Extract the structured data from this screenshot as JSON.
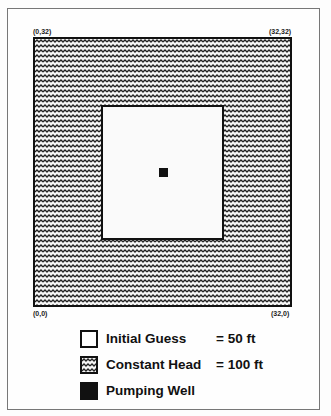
{
  "diagram": {
    "corners": {
      "top_left": "(0,32)",
      "top_right": "(32,32)",
      "bottom_left": "(0,0)",
      "bottom_right": "(32,0)"
    },
    "regions": [
      {
        "name": "constant-head-boundary",
        "pattern": "wavy"
      },
      {
        "name": "initial-guess-interior",
        "pattern": "empty"
      },
      {
        "name": "pumping-well",
        "pattern": "solid"
      }
    ]
  },
  "legend": {
    "items": [
      {
        "label": "Initial Guess",
        "value": "= 50 ft",
        "swatch": "empty"
      },
      {
        "label": "Constant Head",
        "value": "= 100 ft",
        "swatch": "wavy"
      },
      {
        "label": "Pumping Well",
        "value": "",
        "swatch": "solid"
      }
    ]
  }
}
